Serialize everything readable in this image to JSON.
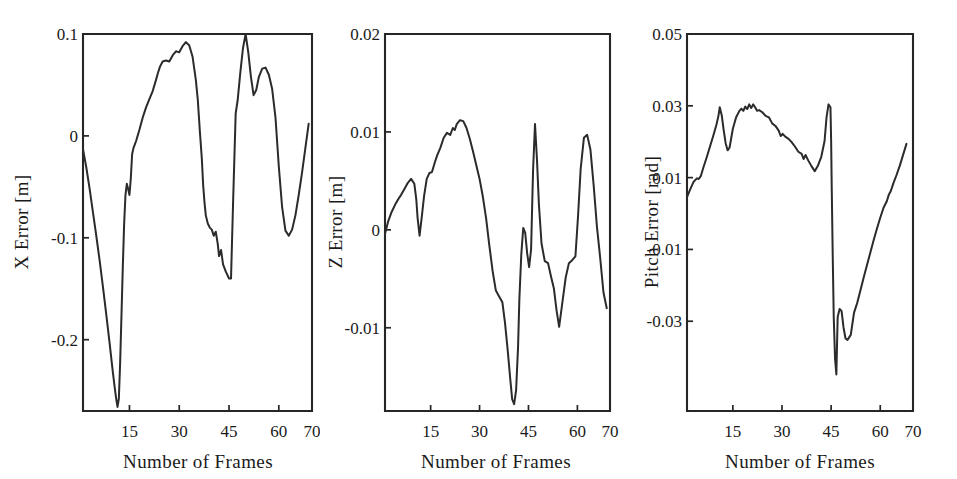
{
  "figure": {
    "background_color": "#ffffff",
    "line_color": "#2b2b2b",
    "axis_color": "#262626",
    "panel_count": 3
  },
  "chart_data": [
    {
      "type": "line",
      "title": "",
      "xlabel": "Number of Frames",
      "ylabel": "X Error [m]",
      "xlim": [
        1,
        70
      ],
      "ylim": [
        -0.27,
        0.1
      ],
      "xticks": [
        15,
        30,
        45,
        60,
        70
      ],
      "yticks": [
        0.1,
        0,
        -0.1,
        -0.2
      ],
      "ytick_labels": [
        "0.1",
        "0",
        "-0.1",
        "-0.2"
      ],
      "xtick_labels": [
        "15",
        "30",
        "45",
        "60",
        "70"
      ],
      "grid": false,
      "legend": "none",
      "series": [
        {
          "name": "X Error",
          "x": [
            1,
            2,
            3,
            4,
            5,
            6,
            7,
            8,
            9,
            10,
            10.6,
            11,
            11.4,
            11.8,
            12.2,
            12.6,
            13,
            13.4,
            13.8,
            14.2,
            14.6,
            15,
            15.4,
            15.8,
            16.2,
            17,
            18,
            19,
            20,
            21,
            22,
            23,
            23.6,
            24.2,
            25,
            26,
            27,
            28,
            29,
            30,
            31,
            32,
            33,
            34,
            35,
            35.6,
            36.2,
            36.8,
            37.2,
            37.6,
            38,
            38.6,
            39.2,
            39.8,
            40.4,
            41,
            41.6,
            42,
            42.6,
            43.2,
            44,
            45,
            45.6,
            46.2,
            47,
            47.6,
            48.4,
            49.2,
            50,
            50.8,
            51.6,
            52.4,
            53.2,
            54,
            55,
            56,
            57,
            58,
            59,
            60,
            61,
            62,
            63,
            64,
            65,
            66,
            67,
            68,
            69
          ],
          "y": [
            -0.013,
            -0.031,
            -0.052,
            -0.075,
            -0.098,
            -0.122,
            -0.148,
            -0.175,
            -0.203,
            -0.232,
            -0.248,
            -0.258,
            -0.266,
            -0.258,
            -0.222,
            -0.175,
            -0.128,
            -0.086,
            -0.058,
            -0.047,
            -0.052,
            -0.058,
            -0.042,
            -0.018,
            -0.012,
            -0.005,
            0.006,
            0.018,
            0.028,
            0.036,
            0.044,
            0.055,
            0.062,
            0.068,
            0.073,
            0.074,
            0.073,
            0.079,
            0.083,
            0.082,
            0.088,
            0.092,
            0.089,
            0.078,
            0.055,
            0.035,
            0.005,
            -0.022,
            -0.048,
            -0.065,
            -0.078,
            -0.086,
            -0.09,
            -0.092,
            -0.098,
            -0.094,
            -0.106,
            -0.118,
            -0.112,
            -0.126,
            -0.133,
            -0.14,
            -0.14,
            -0.068,
            0.022,
            0.035,
            0.062,
            0.086,
            0.1,
            0.082,
            0.058,
            0.04,
            0.045,
            0.058,
            0.066,
            0.067,
            0.06,
            0.046,
            0.018,
            -0.03,
            -0.07,
            -0.093,
            -0.098,
            -0.092,
            -0.078,
            -0.058,
            -0.036,
            -0.012,
            0.012,
            0.04,
            0.062,
            0.072,
            0.095
          ]
        }
      ]
    },
    {
      "type": "line",
      "title": "",
      "xlabel": "Number of Frames",
      "ylabel": "Z Error [m]",
      "xlim": [
        1,
        70
      ],
      "ylim": [
        -0.0185,
        0.02
      ],
      "xticks": [
        15,
        30,
        45,
        60,
        70
      ],
      "yticks": [
        0.02,
        0.01,
        0,
        -0.01
      ],
      "ytick_labels": [
        "0.02",
        "0.01",
        "0",
        "-0.01"
      ],
      "xtick_labels": [
        "15",
        "30",
        "45",
        "60",
        "70"
      ],
      "grid": false,
      "legend": "none",
      "series": [
        {
          "name": "Z Error",
          "x": [
            1,
            2,
            3,
            4,
            5,
            6,
            7,
            8,
            9,
            10,
            10.6,
            11,
            11.6,
            12.2,
            13,
            13.8,
            14.6,
            15.4,
            16.2,
            17,
            18,
            19,
            20,
            21,
            21.8,
            22.4,
            23,
            24,
            25,
            26,
            27,
            28,
            29,
            30,
            31,
            32,
            33,
            34,
            35,
            36,
            37,
            37.8,
            38.6,
            39.4,
            40,
            40.6,
            41.2,
            41.8,
            42.2,
            42.8,
            43.4,
            44,
            44.6,
            45.2,
            45.8,
            46.4,
            47,
            47.6,
            48.2,
            49,
            50,
            51,
            52,
            52.8,
            53.6,
            54.4,
            55.4,
            56.4,
            57.4,
            58.4,
            59.4,
            60.2,
            61,
            62,
            63,
            64,
            65,
            66,
            67,
            68,
            69
          ],
          "y": [
            -0.0004,
            0.0009,
            0.0018,
            0.0025,
            0.0031,
            0.0036,
            0.0042,
            0.0048,
            0.0052,
            0.0047,
            0.0031,
            0.0012,
            -0.0006,
            0.0011,
            0.0035,
            0.0052,
            0.0058,
            0.0059,
            0.0068,
            0.0076,
            0.0084,
            0.0094,
            0.0099,
            0.0097,
            0.0104,
            0.0102,
            0.0108,
            0.0112,
            0.0111,
            0.0104,
            0.0093,
            0.008,
            0.0066,
            0.0052,
            0.0034,
            0.0012,
            -0.0016,
            -0.0042,
            -0.0062,
            -0.0068,
            -0.0074,
            -0.0095,
            -0.0122,
            -0.0152,
            -0.0173,
            -0.0178,
            -0.0164,
            -0.012,
            -0.0071,
            -0.0025,
            0.0002,
            -0.0003,
            -0.0024,
            -0.0038,
            -0.002,
            0.006,
            0.0108,
            0.0072,
            0.0026,
            -0.0014,
            -0.0032,
            -0.0034,
            -0.0049,
            -0.006,
            -0.0082,
            -0.0099,
            -0.0074,
            -0.0049,
            -0.0034,
            -0.0031,
            -0.0027,
            0.0014,
            0.0062,
            0.0094,
            0.0097,
            0.0082,
            0.0045,
            0.0003,
            -0.0029,
            -0.0064,
            -0.008,
            -0.0036
          ]
        }
      ]
    },
    {
      "type": "line",
      "title": "",
      "xlabel": "Number of Frames",
      "ylabel": "Pitch Error [rad]",
      "xlim": [
        1,
        70
      ],
      "ylim": [
        -0.055,
        0.05
      ],
      "xticks": [
        15,
        30,
        45,
        60,
        70
      ],
      "yticks": [
        0.05,
        0.03,
        0.01,
        -0.01,
        -0.03
      ],
      "ytick_labels": [
        "0.05",
        "0.03",
        "0.01",
        "-0.01",
        "-0.03"
      ],
      "xtick_labels": [
        "15",
        "30",
        "45",
        "60",
        "70"
      ],
      "grid": false,
      "legend": "none",
      "series": [
        {
          "name": "Pitch Error",
          "x": [
            1,
            2,
            3,
            4,
            4.6,
            5.2,
            6,
            7,
            8,
            9,
            10,
            10.6,
            11,
            11.6,
            12.2,
            12.8,
            13.4,
            14,
            15,
            16,
            17,
            17.6,
            18.2,
            18.8,
            19.4,
            20,
            20.6,
            21.2,
            21.8,
            22.4,
            23,
            24,
            25,
            26,
            27,
            28,
            29,
            29.6,
            30.2,
            31,
            32,
            33,
            34,
            35,
            36,
            36.6,
            37.2,
            38,
            39,
            40,
            41,
            42,
            43,
            43.6,
            44.2,
            44.8,
            45,
            45.2,
            45.5,
            45.8,
            46.2,
            46.6,
            47,
            47.6,
            48.2,
            48.8,
            49.4,
            50,
            51,
            52,
            53,
            54,
            55,
            56,
            57,
            58,
            59,
            60,
            61,
            62,
            62.6,
            63.2,
            64,
            65,
            66,
            67,
            68
          ],
          "y": [
            0.0046,
            0.0068,
            0.0088,
            0.0098,
            0.0096,
            0.0104,
            0.0128,
            0.0156,
            0.0186,
            0.0216,
            0.0248,
            0.0272,
            0.0296,
            0.0274,
            0.0232,
            0.0196,
            0.0176,
            0.0184,
            0.0236,
            0.0268,
            0.0286,
            0.0292,
            0.0286,
            0.0298,
            0.0291,
            0.0304,
            0.0294,
            0.0304,
            0.0296,
            0.0286,
            0.0288,
            0.0282,
            0.0272,
            0.0268,
            0.0251,
            0.0244,
            0.0231,
            0.0216,
            0.0222,
            0.0214,
            0.0208,
            0.0198,
            0.0186,
            0.0172,
            0.0166,
            0.0152,
            0.0163,
            0.0148,
            0.0132,
            0.0118,
            0.0134,
            0.0158,
            0.0202,
            0.0268,
            0.0304,
            0.0296,
            0.0206,
            0.0064,
            -0.0122,
            -0.0288,
            -0.0404,
            -0.0448,
            -0.0288,
            -0.0266,
            -0.0272,
            -0.0318,
            -0.0348,
            -0.0352,
            -0.0338,
            -0.0276,
            -0.0248,
            -0.0212,
            -0.0176,
            -0.0142,
            -0.0108,
            -0.0074,
            -0.0042,
            -0.0012,
            0.0016,
            0.0034,
            0.0052,
            0.0062,
            0.0084,
            0.0108,
            0.0134,
            0.0164,
            0.0194,
            0.0224
          ]
        }
      ]
    }
  ],
  "panels": [
    {
      "id": "x-error",
      "ylabel": "X Error [m]",
      "xlabel": "Number of Frames",
      "ytick_labels": [
        "0.1",
        "0",
        "-0.1",
        "-0.2"
      ],
      "xtick_labels": [
        "15",
        "30",
        "45",
        "60",
        "70"
      ]
    },
    {
      "id": "z-error",
      "ylabel": "Z Error [m]",
      "xlabel": "Number of Frames",
      "ytick_labels": [
        "0.02",
        "0.01",
        "0",
        "-0.01"
      ],
      "xtick_labels": [
        "15",
        "30",
        "45",
        "60",
        "70"
      ]
    },
    {
      "id": "pitch-error",
      "ylabel": "Pitch Error [rad]",
      "xlabel": "Number of Frames",
      "ytick_labels": [
        "0.05",
        "0.03",
        "0.01",
        "-0.01",
        "-0.03"
      ],
      "xtick_labels": [
        "15",
        "30",
        "45",
        "60",
        "70"
      ]
    }
  ]
}
